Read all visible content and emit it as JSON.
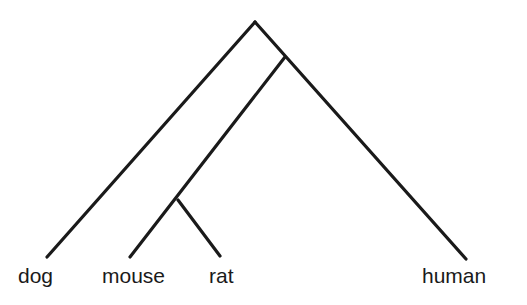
{
  "diagram": {
    "type": "phylogenetic-tree",
    "line_color": "#1a1a1a",
    "background": "#ffffff",
    "nodes": {
      "root": {
        "x": 255,
        "y": 22
      },
      "inner1": {
        "x": 285,
        "y": 57
      },
      "inner2": {
        "x": 178,
        "y": 200
      }
    },
    "leaves": [
      {
        "id": "dog",
        "label": "dog",
        "x": 47,
        "y": 257,
        "label_x": 18,
        "label_y": 283
      },
      {
        "id": "mouse",
        "label": "mouse",
        "x": 130,
        "y": 257,
        "label_x": 102,
        "label_y": 283
      },
      {
        "id": "rat",
        "label": "rat",
        "x": 220,
        "y": 256,
        "label_x": 209,
        "label_y": 283
      },
      {
        "id": "human",
        "label": "human",
        "x": 466,
        "y": 259,
        "label_x": 422,
        "label_y": 283
      }
    ],
    "edges": [
      {
        "from": "root",
        "to": "dog"
      },
      {
        "from": "root",
        "to": "human"
      },
      {
        "from": "inner1",
        "to": "mouse"
      },
      {
        "from": "inner2",
        "to": "rat"
      }
    ],
    "topology": "(dog,((mouse,rat),human))"
  }
}
